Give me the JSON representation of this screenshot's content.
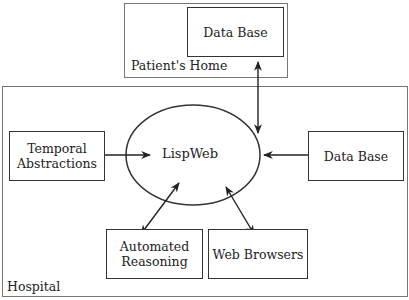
{
  "diagram": {
    "regions": {
      "patients_home": {
        "label": "Patient's Home"
      },
      "hospital": {
        "label": "Hospital"
      }
    },
    "nodes": {
      "home_database": {
        "label": "Data Base"
      },
      "lispweb": {
        "label": "LispWeb"
      },
      "temporal_abstractions": {
        "line1": "Temporal",
        "line2": "Abstractions"
      },
      "hospital_database": {
        "label": "Data Base"
      },
      "automated_reasoning": {
        "line1": "Automated",
        "line2": "Reasoning"
      },
      "web_browsers": {
        "label": "Web Browsers"
      }
    },
    "edges": [
      {
        "from": "home_database",
        "to": "lispweb",
        "type": "bidirectional"
      },
      {
        "from": "temporal_abstractions",
        "to": "lispweb",
        "type": "bidirectional"
      },
      {
        "from": "lispweb",
        "to": "hospital_database",
        "type": "bidirectional"
      },
      {
        "from": "lispweb",
        "to": "automated_reasoning",
        "type": "bidirectional"
      },
      {
        "from": "lispweb",
        "to": "web_browsers",
        "type": "bidirectional"
      }
    ]
  }
}
